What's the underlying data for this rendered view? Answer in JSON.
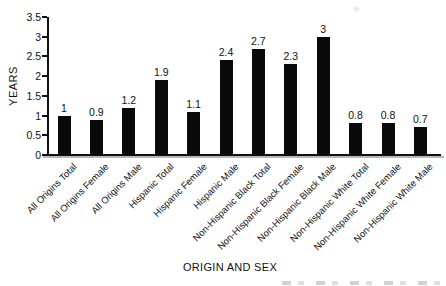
{
  "chart_data": {
    "type": "bar",
    "title": "",
    "xlabel": "ORIGIN AND SEX",
    "ylabel": "YEARS",
    "categories": [
      "All Origins Total",
      "All Origins Female",
      "All Origins Male",
      "Hispanic Total",
      "Hispanic Female",
      "Hispanic Male",
      "Non-Hispanic Black Total",
      "Non-Hispanic Black Female",
      "Non-Hispanic Black Male",
      "Non-Hispanic White Total",
      "Non-Hispanic White Female",
      "Non-Hispanic White Male"
    ],
    "values": [
      1,
      0.9,
      1.2,
      1.9,
      1.1,
      2.4,
      2.7,
      2.3,
      3,
      0.8,
      0.8,
      0.7
    ],
    "value_labels": [
      "1",
      "0.9",
      "1.2",
      "1.9",
      "1.1",
      "2.4",
      "2.7",
      "2.3",
      "3",
      "0.8",
      "0.8",
      "0.7"
    ],
    "ylim": [
      0,
      3.5
    ],
    "yticks": [
      0,
      0.5,
      1,
      1.5,
      2,
      2.5,
      3,
      3.5
    ],
    "ytick_labels": [
      "0",
      "0.5",
      "1",
      "1.5",
      "2",
      "2.5",
      "3",
      "3.5"
    ],
    "bar_color": "#0a0a0a",
    "grid": false,
    "legend": null
  }
}
